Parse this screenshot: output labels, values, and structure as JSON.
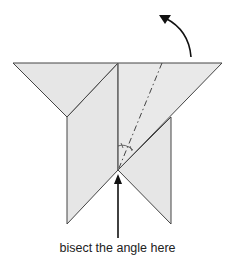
{
  "diagram": {
    "type": "origami fold step",
    "caption": "bisect the angle here",
    "colors": {
      "paper": "#e6e6e6",
      "edge": "#333333",
      "crease": "#666666",
      "arrow": "#111111"
    },
    "annotations": {
      "rotate_arrow": "curved arrow indicating fold over/back",
      "pointer_arrow": "straight arrow pointing up at vertex",
      "angle_marks": "equal-angle tick marks at bisected vertex",
      "valley_fold_line": "dash-dot line bisecting angle"
    }
  }
}
